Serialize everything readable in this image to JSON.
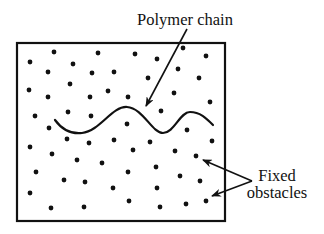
{
  "diagram": {
    "labels": {
      "polymer_chain": "Polymer chain",
      "fixed_line1": "Fixed",
      "fixed_line2": "obstacles"
    },
    "colors": {
      "ink": "#111111",
      "background": "#ffffff"
    },
    "box": {
      "x": 17,
      "y": 43,
      "width": 208,
      "height": 178
    },
    "polymer_path": "M55,120 C63,131 73,134 82,133 C100,131 112,106 127,107 C143,108 152,133 163,133 C174,133 180,112 190,112 C200,112 206,118 213,125",
    "arrows": [
      {
        "name": "polymer-chain-arrow",
        "from": [
          187,
          29
        ],
        "to": [
          146,
          106
        ]
      },
      {
        "name": "obstacle-arrow-upper",
        "from": [
          252,
          181
        ],
        "to": [
          203,
          160
        ]
      },
      {
        "name": "obstacle-arrow-lower",
        "from": [
          252,
          181
        ],
        "to": [
          212,
          196
        ]
      }
    ],
    "obstacles": [
      [
        54,
        52
      ],
      [
        98,
        53
      ],
      [
        30,
        62
      ],
      [
        73,
        64
      ],
      [
        48,
        72
      ],
      [
        92,
        73
      ],
      [
        114,
        72
      ],
      [
        29,
        90
      ],
      [
        70,
        84
      ],
      [
        48,
        97
      ],
      [
        90,
        97
      ],
      [
        108,
        91
      ],
      [
        35,
        116
      ],
      [
        68,
        112
      ],
      [
        91,
        116
      ],
      [
        135,
        54
      ],
      [
        157,
        59
      ],
      [
        183,
        48
      ],
      [
        206,
        56
      ],
      [
        178,
        69
      ],
      [
        148,
        78
      ],
      [
        199,
        78
      ],
      [
        128,
        97
      ],
      [
        174,
        93
      ],
      [
        210,
        102
      ],
      [
        161,
        111
      ],
      [
        49,
        128
      ],
      [
        67,
        139
      ],
      [
        89,
        143
      ],
      [
        114,
        140
      ],
      [
        30,
        147
      ],
      [
        52,
        154
      ],
      [
        77,
        160
      ],
      [
        102,
        163
      ],
      [
        127,
        124
      ],
      [
        187,
        130
      ],
      [
        150,
        142
      ],
      [
        212,
        141
      ],
      [
        133,
        150
      ],
      [
        175,
        151
      ],
      [
        196,
        156
      ],
      [
        36,
        172
      ],
      [
        64,
        180
      ],
      [
        85,
        182
      ],
      [
        113,
        188
      ],
      [
        128,
        172
      ],
      [
        30,
        193
      ],
      [
        51,
        208
      ],
      [
        84,
        207
      ],
      [
        129,
        201
      ],
      [
        156,
        167
      ],
      [
        180,
        176
      ],
      [
        200,
        181
      ],
      [
        157,
        188
      ],
      [
        160,
        207
      ],
      [
        186,
        204
      ],
      [
        206,
        201
      ]
    ]
  }
}
